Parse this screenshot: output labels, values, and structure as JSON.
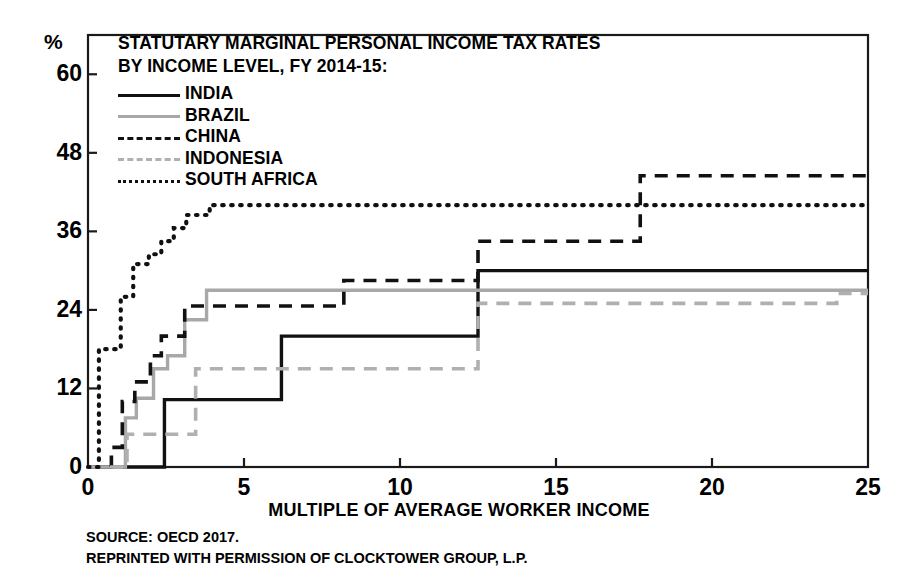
{
  "chart_data": {
    "type": "line",
    "title": "STATUTARY MARGINAL PERSONAL INCOME TAX RATES",
    "subtitle": "BY INCOME LEVEL, FY 2014-15:",
    "xlabel": "MULTIPLE OF AVERAGE WORKER INCOME",
    "ylabel": "%",
    "xlim": [
      0,
      25
    ],
    "ylim": [
      0,
      66
    ],
    "xticks": [
      0,
      5,
      10,
      15,
      20,
      25
    ],
    "yticks": [
      0,
      12,
      24,
      36,
      48,
      60
    ],
    "grid": false,
    "legend_position": "top-left",
    "step_style": "post",
    "series": [
      {
        "name": "INDIA",
        "style": "solid",
        "color": "#111111",
        "x": [
          0,
          2.45,
          2.45,
          6.2,
          6.2,
          12.5,
          12.5,
          25
        ],
        "y": [
          0,
          0,
          10.3,
          10.3,
          20.0,
          20.0,
          30.0,
          30.0
        ]
      },
      {
        "name": "BRAZIL",
        "style": "solid",
        "color": "#a8a8a8",
        "x": [
          0,
          1.2,
          1.2,
          1.55,
          1.55,
          2.1,
          2.1,
          2.55,
          2.55,
          3.1,
          3.1,
          3.8,
          3.8,
          25
        ],
        "y": [
          0,
          0,
          7.5,
          7.5,
          10.5,
          10.5,
          15.0,
          15.0,
          17.0,
          17.0,
          22.5,
          22.5,
          27.0,
          27.0
        ]
      },
      {
        "name": "CHINA",
        "style": "dashed",
        "color": "#111111",
        "x": [
          0,
          0.75,
          0.75,
          1.1,
          1.1,
          1.5,
          1.5,
          2.0,
          2.0,
          2.35,
          2.35,
          3.1,
          3.1,
          8.2,
          8.2,
          12.5,
          12.5,
          17.7,
          17.7,
          25
        ],
        "y": [
          0,
          0,
          3.0,
          3.0,
          10.0,
          10.0,
          13.0,
          13.0,
          17.0,
          17.0,
          20.0,
          20.0,
          24.6,
          24.6,
          28.5,
          28.5,
          34.5,
          34.5,
          44.5,
          44.5
        ]
      },
      {
        "name": "INDONESIA",
        "style": "dashed",
        "color": "#b0b0b0",
        "x": [
          0,
          1.25,
          1.25,
          3.45,
          3.45,
          12.5,
          12.5,
          24.0,
          24.0,
          25
        ],
        "y": [
          0,
          0,
          5.0,
          5.0,
          15.0,
          15.0,
          25.0,
          25.0,
          26.5,
          26.5
        ]
      },
      {
        "name": "SOUTH AFRICA",
        "style": "dotted",
        "color": "#111111",
        "x": [
          0,
          0.35,
          0.35,
          1.05,
          1.05,
          1.45,
          1.45,
          1.95,
          1.95,
          2.35,
          2.35,
          2.75,
          2.75,
          3.15,
          3.15,
          3.9,
          3.9,
          25
        ],
        "y": [
          0,
          0,
          18.0,
          18.0,
          26.0,
          26.0,
          31.0,
          31.0,
          32.5,
          32.5,
          34.5,
          34.5,
          36.5,
          36.5,
          38.5,
          38.5,
          40.0,
          40.0
        ]
      }
    ]
  },
  "legend": [
    {
      "label": "INDIA",
      "swatch": "sw-solid-dark"
    },
    {
      "label": "BRAZIL",
      "swatch": "sw-solid-gray"
    },
    {
      "label": "CHINA",
      "swatch": "sw-dash-dark"
    },
    {
      "label": "INDONESIA",
      "swatch": "sw-dash-gray"
    },
    {
      "label": "SOUTH AFRICA",
      "swatch": "sw-dot-dark"
    }
  ],
  "footer": {
    "source": "SOURCE: OECD 2017.",
    "permission": "REPRINTED WITH PERMISSION OF CLOCKTOWER GROUP, L.P."
  },
  "colors": {
    "axis": "#1a1a1a",
    "dark_series": "#111111",
    "gray_series": "#a8a8a8",
    "background": "#ffffff"
  }
}
